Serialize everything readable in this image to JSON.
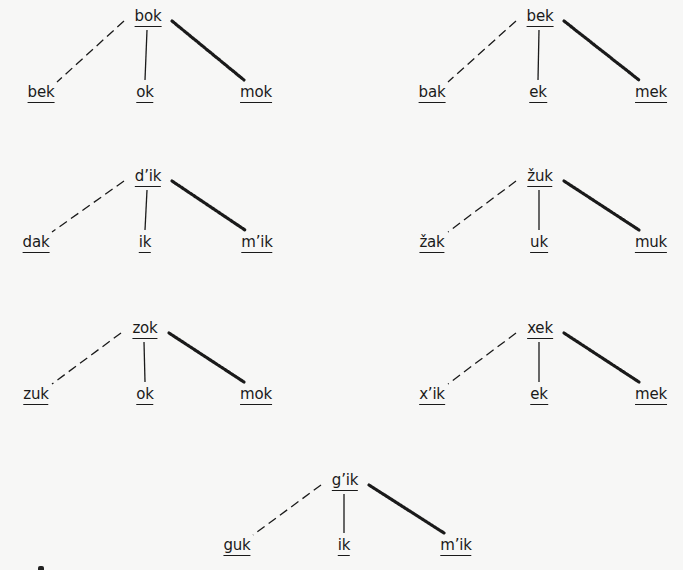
{
  "diagram": {
    "type": "derivation-trees",
    "edge_styles": {
      "left": "dashed",
      "middle": "solid",
      "right": "beaded-thick"
    },
    "trees": [
      {
        "id": "t1",
        "root": {
          "label": "bok",
          "x": 148,
          "y": 8
        },
        "children": [
          {
            "label": "bek",
            "x": 41,
            "y": 84,
            "edge": "dashed"
          },
          {
            "label": "ok",
            "x": 145,
            "y": 84,
            "edge": "solid"
          },
          {
            "label": "mok",
            "x": 256,
            "y": 84,
            "edge": "beaded"
          }
        ]
      },
      {
        "id": "t2",
        "root": {
          "label": "bek",
          "x": 540,
          "y": 8
        },
        "children": [
          {
            "label": "bak",
            "x": 432,
            "y": 84,
            "edge": "dashed"
          },
          {
            "label": "ek",
            "x": 538,
            "y": 84,
            "edge": "solid"
          },
          {
            "label": "mek",
            "x": 651,
            "y": 84,
            "edge": "beaded"
          }
        ]
      },
      {
        "id": "t3",
        "root": {
          "label": "d’ik",
          "x": 148,
          "y": 168
        },
        "children": [
          {
            "label": "dak",
            "x": 36,
            "y": 234,
            "edge": "dashed"
          },
          {
            "label": "ik",
            "x": 145,
            "y": 234,
            "edge": "solid"
          },
          {
            "label": "m’ik",
            "x": 257,
            "y": 234,
            "edge": "beaded"
          }
        ]
      },
      {
        "id": "t4",
        "root": {
          "label": "žuk",
          "x": 540,
          "y": 168
        },
        "children": [
          {
            "label": "žak",
            "x": 432,
            "y": 234,
            "edge": "dashed"
          },
          {
            "label": "uk",
            "x": 539,
            "y": 234,
            "edge": "solid"
          },
          {
            "label": "muk",
            "x": 651,
            "y": 234,
            "edge": "beaded"
          }
        ]
      },
      {
        "id": "t5",
        "root": {
          "label": "zok",
          "x": 145,
          "y": 320
        },
        "children": [
          {
            "label": "zuk",
            "x": 36,
            "y": 386,
            "edge": "dashed"
          },
          {
            "label": "ok",
            "x": 145,
            "y": 386,
            "edge": "solid"
          },
          {
            "label": "mok",
            "x": 256,
            "y": 386,
            "edge": "beaded"
          }
        ]
      },
      {
        "id": "t6",
        "root": {
          "label": "xek",
          "x": 540,
          "y": 320
        },
        "children": [
          {
            "label": "x’ik",
            "x": 432,
            "y": 386,
            "edge": "dashed"
          },
          {
            "label": "ek",
            "x": 539,
            "y": 386,
            "edge": "solid"
          },
          {
            "label": "mek",
            "x": 651,
            "y": 386,
            "edge": "beaded"
          }
        ]
      },
      {
        "id": "t7",
        "root": {
          "label": "g’ik",
          "x": 345,
          "y": 472
        },
        "children": [
          {
            "label": "guk",
            "x": 237,
            "y": 537,
            "edge": "dashed"
          },
          {
            "label": "ik",
            "x": 344,
            "y": 537,
            "edge": "solid"
          },
          {
            "label": "m’ik",
            "x": 456,
            "y": 537,
            "edge": "beaded"
          }
        ]
      }
    ],
    "colors": {
      "ink": "#1a1a1a",
      "paper": "#f7f7f6"
    }
  }
}
